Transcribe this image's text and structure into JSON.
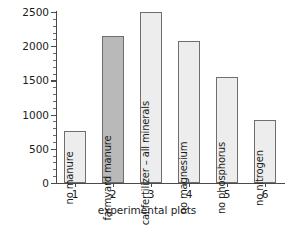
{
  "chart_data": {
    "type": "bar",
    "title": "",
    "xlabel": "experimental plots",
    "ylabel": "yield (kg per hectare)",
    "categories": [
      "1",
      "2",
      "3",
      "4",
      "5",
      "6"
    ],
    "bar_labels": [
      "no manure",
      "farmyard manure",
      "chemical fertilizer – all minerals",
      "no magnesium",
      "no phosphorus",
      "no nitrogen"
    ],
    "values": [
      760,
      2150,
      2500,
      2080,
      1550,
      920
    ],
    "ylim": [
      0,
      2500
    ],
    "ytick_labels": [
      "0",
      "500",
      "1000",
      "1500",
      "2000",
      "2500"
    ],
    "ytick_values": [
      0,
      500,
      1000,
      1500,
      2000,
      2500
    ],
    "yminor_step": 100,
    "grid": false,
    "legend": "none",
    "bar_colors": [
      "#ededed",
      "#b9b9b9",
      "#ededed",
      "#ededed",
      "#ededed",
      "#ededed"
    ],
    "bar_border_color": "#6e6e6e",
    "axis_color": "#4a4a4a",
    "text_color": "#1c1c1c",
    "background": "#ffffff"
  }
}
